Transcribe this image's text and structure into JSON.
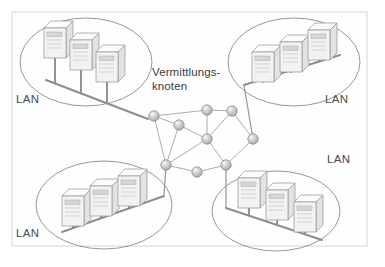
{
  "figure": {
    "frame": {
      "x": 12,
      "y": 12,
      "width": 355,
      "height": 234
    },
    "background_color": "#ffffff",
    "border_color": "#d9d9d9"
  },
  "center_label": {
    "line1": "Vermittlungs-",
    "line2": "knoten",
    "x": 152,
    "y": 76,
    "color": "#3d3d3d"
  },
  "lans": [
    {
      "id": "lan-top-left",
      "label": "LAN",
      "label_x": 16,
      "label_y": 103,
      "oval": {
        "cx": 86,
        "cy": 62,
        "rx": 66,
        "ry": 44
      },
      "bus": {
        "x1": 46,
        "y1": 80,
        "x2": 148,
        "y2": 119
      },
      "hosts": [
        {
          "x": 44,
          "y": 28,
          "w": 22,
          "h": 30
        },
        {
          "x": 70,
          "y": 40,
          "w": 22,
          "h": 30
        },
        {
          "x": 96,
          "y": 52,
          "w": 22,
          "h": 30
        }
      ],
      "uplink_node": 0
    },
    {
      "id": "lan-top-right",
      "label": "LAN",
      "label_x": 325,
      "label_y": 103,
      "oval": {
        "cx": 294,
        "cy": 62,
        "rx": 66,
        "ry": 44
      },
      "bus": {
        "x1": 244,
        "y1": 85,
        "x2": 340,
        "y2": 55
      },
      "hosts": [
        {
          "x": 252,
          "y": 52,
          "w": 22,
          "h": 30
        },
        {
          "x": 280,
          "y": 42,
          "w": 22,
          "h": 30
        },
        {
          "x": 308,
          "y": 30,
          "w": 22,
          "h": 30
        }
      ],
      "uplink_node": 5
    },
    {
      "id": "lan-bottom-left",
      "label": "LAN",
      "label_x": 16,
      "label_y": 237,
      "oval": {
        "cx": 104,
        "cy": 205,
        "rx": 68,
        "ry": 44
      },
      "bus": {
        "x1": 62,
        "y1": 232,
        "x2": 164,
        "y2": 196
      },
      "hosts": [
        {
          "x": 62,
          "y": 196,
          "w": 22,
          "h": 30
        },
        {
          "x": 90,
          "y": 186,
          "w": 22,
          "h": 30
        },
        {
          "x": 118,
          "y": 176,
          "w": 22,
          "h": 30
        }
      ],
      "uplink_node": 6
    },
    {
      "id": "lan-bottom-right",
      "label": "LAN",
      "label_x": 327,
      "label_y": 163,
      "oval": {
        "cx": 276,
        "cy": 211,
        "rx": 64,
        "ry": 40
      },
      "bus": {
        "x1": 226,
        "y1": 208,
        "x2": 322,
        "y2": 240
      },
      "hosts": [
        {
          "x": 238,
          "y": 178,
          "w": 22,
          "h": 30
        },
        {
          "x": 266,
          "y": 190,
          "w": 22,
          "h": 30
        },
        {
          "x": 294,
          "y": 202,
          "w": 22,
          "h": 30
        }
      ],
      "uplink_node": 8
    }
  ],
  "mesh": {
    "node_radius": 5.2,
    "node_color": "#c2c2c2",
    "edge_color": "#a8a8a8",
    "nodes": [
      {
        "id": "n0",
        "x": 154,
        "y": 116
      },
      {
        "id": "n1",
        "x": 179,
        "y": 125
      },
      {
        "id": "n2",
        "x": 207,
        "y": 110
      },
      {
        "id": "n3",
        "x": 232,
        "y": 111
      },
      {
        "id": "n4",
        "x": 207,
        "y": 139
      },
      {
        "id": "n5",
        "x": 253,
        "y": 139
      },
      {
        "id": "n6",
        "x": 166,
        "y": 165
      },
      {
        "id": "n7",
        "x": 197,
        "y": 172
      },
      {
        "id": "n8",
        "x": 226,
        "y": 165
      }
    ],
    "edges": [
      [
        "n0",
        "n1"
      ],
      [
        "n0",
        "n2"
      ],
      [
        "n0",
        "n6"
      ],
      [
        "n1",
        "n6"
      ],
      [
        "n1",
        "n4"
      ],
      [
        "n2",
        "n3"
      ],
      [
        "n2",
        "n4"
      ],
      [
        "n3",
        "n4"
      ],
      [
        "n3",
        "n5"
      ],
      [
        "n4",
        "n6"
      ],
      [
        "n4",
        "n8"
      ],
      [
        "n5",
        "n8"
      ],
      [
        "n6",
        "n7"
      ],
      [
        "n7",
        "n8"
      ]
    ]
  }
}
